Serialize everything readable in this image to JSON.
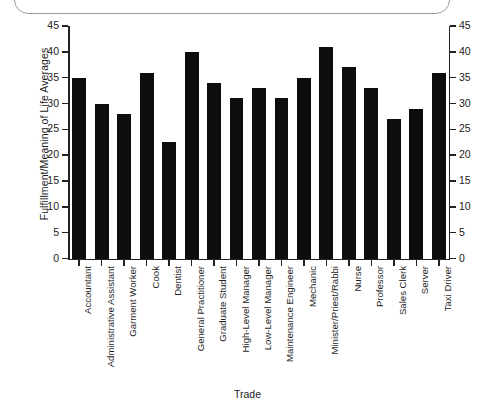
{
  "frame": {
    "name": "rounded-container-edge"
  },
  "chart_data": {
    "type": "bar",
    "title": "",
    "xlabel": "Trade",
    "ylabel": "Fulfillment/Meaning of Life Averages",
    "ylim": [
      0,
      45
    ],
    "yticks": [
      0,
      5,
      10,
      15,
      20,
      25,
      30,
      35,
      40,
      45
    ],
    "ytick_labels": [
      "0",
      "5",
      "10",
      "15",
      "20",
      "25",
      "30",
      "35",
      "40",
      "45"
    ],
    "right_axis_labels": [
      "0",
      "5",
      "10",
      "15",
      "20",
      "25",
      "30",
      "35",
      "40",
      "45"
    ],
    "grid": false,
    "legend": null,
    "bar_color": "#0d0d0d",
    "categories": [
      "Accountant",
      "Administrative Assistant",
      "Garment Worker",
      "Cook",
      "Dentist",
      "General Practitioner",
      "Graduate Student",
      "High-Level Manager",
      "Low-Level Manager",
      "Maintenance Engineer",
      "Mechanic",
      "Minister/Priest/Rabbi",
      "Nurse",
      "Professor",
      "Sales Clerk",
      "Server",
      "Taxi Driver"
    ],
    "values": [
      35,
      30,
      28,
      36,
      22.5,
      40,
      34,
      31,
      33,
      31,
      35,
      41,
      37,
      33,
      27,
      29,
      36
    ]
  }
}
